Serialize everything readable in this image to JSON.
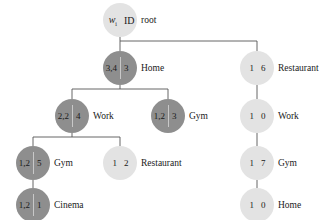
{
  "diagram": {
    "type": "tree",
    "colors": {
      "dark_node": "#8e8e8e",
      "light_node": "#e3e3e3",
      "edge": "#555555"
    },
    "nodes": {
      "root": {
        "w": "w",
        "w_sub": "i",
        "id": "ID",
        "label": "root"
      },
      "home": {
        "w": "3,4",
        "id": "3",
        "label": "Home"
      },
      "work": {
        "w": "2,2",
        "id": "4",
        "label": "Work"
      },
      "gym_mid": {
        "w": "1,2",
        "id": "3",
        "label": "Gym"
      },
      "gym_left": {
        "w": "1,2",
        "id": "5",
        "label": "Gym"
      },
      "restaurant_mid": {
        "w": "1",
        "id": "2",
        "label": "Restaurant"
      },
      "cinema": {
        "w": "1,2",
        "id": "1",
        "label": "Cinema"
      },
      "restaurant_right": {
        "w": "1",
        "id": "6",
        "label": "Restaurant"
      },
      "work_right": {
        "w": "1",
        "id": "0",
        "label": "Work"
      },
      "gym_right": {
        "w": "1",
        "id": "7",
        "label": "Gym"
      },
      "home_right": {
        "w": "1",
        "id": "0",
        "label": "Home"
      }
    }
  }
}
